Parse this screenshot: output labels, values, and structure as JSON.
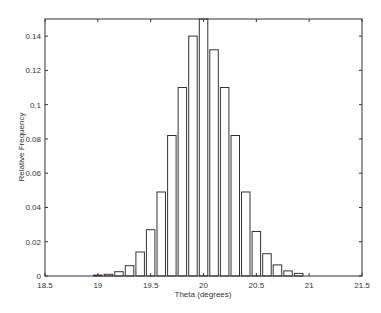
{
  "chart_data": {
    "type": "bar",
    "title": "",
    "xlabel": "Theta (degrees)",
    "ylabel": "Relative Frequency",
    "xlim": [
      18.5,
      21.5
    ],
    "ylim": [
      0,
      0.15
    ],
    "xticks": [
      18.5,
      19,
      19.5,
      20,
      20.5,
      21,
      21.5
    ],
    "xtick_labels": [
      "18.5",
      "19",
      "19.5",
      "20",
      "20.5",
      "21",
      "21.5"
    ],
    "yticks": [
      0,
      0.02,
      0.04,
      0.06,
      0.08,
      0.1,
      0.12,
      0.14
    ],
    "ytick_labels": [
      "0",
      "0.02",
      "0.04",
      "0.06",
      "0.08",
      "0.1",
      "0.12",
      "0.14"
    ],
    "grid": false,
    "legend": null,
    "bar_width": 0.08,
    "bar_fill": "#ffffff",
    "bar_edge": "#333333",
    "categories": [
      19.0,
      19.1,
      19.2,
      19.3,
      19.4,
      19.5,
      19.6,
      19.7,
      19.8,
      19.9,
      20.0,
      20.1,
      20.2,
      20.3,
      20.4,
      20.5,
      20.6,
      20.7,
      20.8,
      20.9
    ],
    "values": [
      0.0005,
      0.001,
      0.0025,
      0.006,
      0.014,
      0.027,
      0.049,
      0.082,
      0.11,
      0.14,
      0.152,
      0.132,
      0.11,
      0.082,
      0.049,
      0.026,
      0.013,
      0.0065,
      0.003,
      0.0015
    ]
  }
}
